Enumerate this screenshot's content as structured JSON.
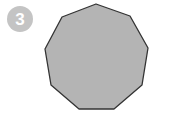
{
  "badge": {
    "number": "3",
    "color": "#c4c4c4",
    "text_color": "#ffffff"
  },
  "shape": {
    "type": "nonagon",
    "sides": 9,
    "fill": "#b4b4b4",
    "stroke": "#333333",
    "points": "96,4 130,16 148,48 142,85 114,109 79,109 51,85 45,49 62,17"
  }
}
